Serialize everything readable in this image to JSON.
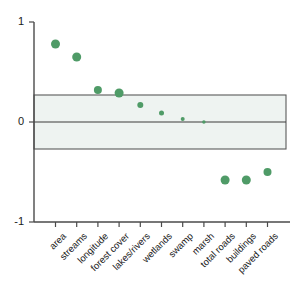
{
  "chart_data": {
    "type": "scatter",
    "title": "",
    "xlabel": "",
    "ylabel": "",
    "ylim": [
      -1,
      1
    ],
    "yticks": [
      1,
      0,
      -1
    ],
    "ytick_labels": [
      "1",
      "0",
      "-1"
    ],
    "grid": false,
    "legend": null,
    "categories": [
      "area",
      "streams",
      "longitude",
      "forest cover",
      "lakes/rivers",
      "wetlands",
      "swamp",
      "marsh",
      "total roads",
      "buildings",
      "paved roads"
    ],
    "values": [
      0.78,
      0.65,
      0.32,
      0.29,
      0.17,
      0.09,
      0.03,
      0.0,
      -0.58,
      -0.58,
      -0.5
    ],
    "marker_sizes": [
      9,
      9,
      8,
      9,
      6,
      5,
      4,
      3.5,
      9,
      9,
      8
    ],
    "marker_color": "#4f9b67",
    "annotations": [
      {
        "type": "band",
        "label": "significance band",
        "y_low": -0.27,
        "y_high": 0.27,
        "fill": "#eef3f1",
        "edge": "#5a5a5a"
      },
      {
        "type": "hline",
        "label": "zero line",
        "y": 0,
        "color": "#3c3c3c"
      }
    ]
  },
  "axis": {
    "y_label_top": "1",
    "y_label_mid": "0",
    "y_label_bottom": "-1"
  }
}
